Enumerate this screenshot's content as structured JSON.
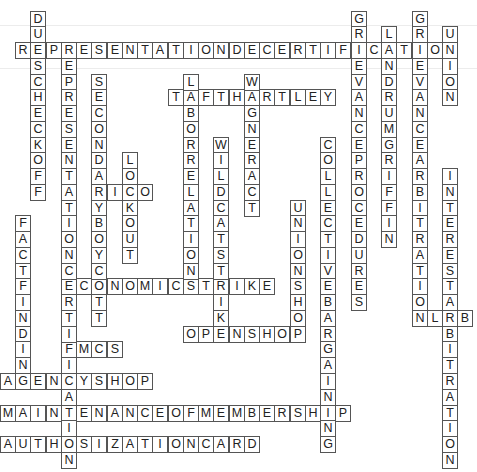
{
  "puzzle": {
    "type": "crossword-solution",
    "grid": {
      "origin_x": 15,
      "origin_y": 10.5,
      "cell_w": 15.25,
      "cell_h": 15.76
    },
    "colors": {
      "border": "#555555",
      "text": "#222222",
      "background": "#ffffff"
    },
    "words": [
      {
        "answer": "REPRESENTATIONDECERTIFICATION",
        "dir": "across",
        "row": 2,
        "col": 0
      },
      {
        "answer": "TAFTHARTLEY",
        "dir": "across",
        "row": 5,
        "col": 10
      },
      {
        "answer": "RICO",
        "dir": "across",
        "row": 11,
        "col": 5
      },
      {
        "answer": "ECONOMICSTRIKE",
        "dir": "across",
        "row": 17,
        "col": 3
      },
      {
        "answer": "NLRB",
        "dir": "across",
        "row": 19,
        "col": 26
      },
      {
        "answer": "OPENSHOP",
        "dir": "across",
        "row": 20,
        "col": 11
      },
      {
        "answer": "FMCS",
        "dir": "across",
        "row": 21,
        "col": 3
      },
      {
        "answer": "AGENCYSHOP",
        "dir": "across",
        "row": 23,
        "col": -1
      },
      {
        "answer": "MAINTENANCEOFMEMBERSHIP",
        "dir": "across",
        "row": 25,
        "col": -1
      },
      {
        "answer": "AUTHOSIZATIONCARD",
        "dir": "across",
        "row": 27,
        "col": -1
      },
      {
        "answer": "DUESCHECKOFF",
        "dir": "down",
        "row": 0,
        "col": 1
      },
      {
        "answer": "REPRESENTATIONCERTIFICATION",
        "dir": "down",
        "row": 2,
        "col": 3
      },
      {
        "answer": "SECONDARYBOYCOTT",
        "dir": "down",
        "row": 4,
        "col": 5
      },
      {
        "answer": "LOCKOUT",
        "dir": "down",
        "row": 9,
        "col": 7
      },
      {
        "answer": "LABORRELATION",
        "dir": "down",
        "row": 4,
        "col": 11
      },
      {
        "answer": "WILDCATSTRIKE",
        "dir": "down",
        "row": 8,
        "col": 13
      },
      {
        "answer": "WAGNERACT",
        "dir": "down",
        "row": 4,
        "col": 15
      },
      {
        "answer": "UNIONSHOP",
        "dir": "down",
        "row": 12,
        "col": 18
      },
      {
        "answer": "COLLECTIVEBARGAINING",
        "dir": "down",
        "row": 8,
        "col": 20
      },
      {
        "answer": "GRIEVANCEPROCEDURES",
        "dir": "down",
        "row": 0,
        "col": 22
      },
      {
        "answer": "LANDRUMGRIFFIN",
        "dir": "down",
        "row": 1,
        "col": 24
      },
      {
        "answer": "GRIEVANCEARBITRATION",
        "dir": "down",
        "row": 0,
        "col": 26
      },
      {
        "answer": "UNION",
        "dir": "down",
        "row": 1,
        "col": 28
      },
      {
        "answer": "INTERESTARBITRATION",
        "dir": "down",
        "row": 10,
        "col": 28
      },
      {
        "answer": "FACTFINDING",
        "dir": "down",
        "row": 13,
        "col": 0
      }
    ]
  }
}
